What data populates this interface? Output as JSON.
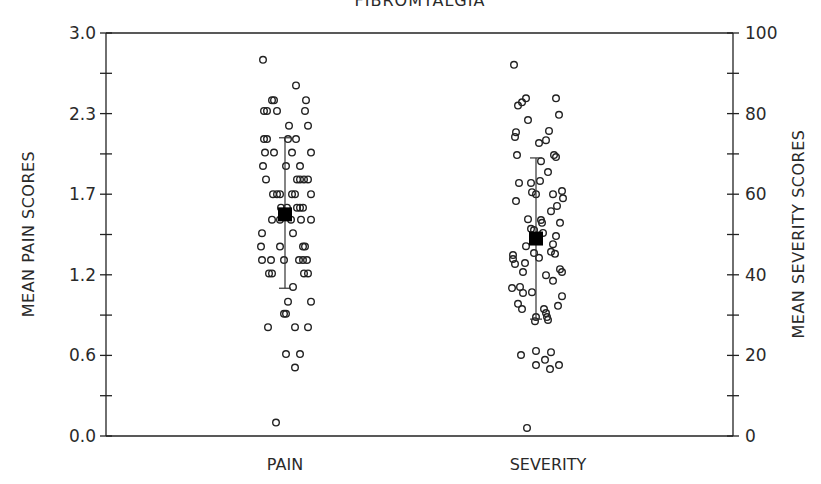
{
  "chart_data": {
    "type": "scatter",
    "title": "FIBROMYALGIA",
    "categories": [
      "PAIN",
      "SEVERITY"
    ],
    "left_axis": {
      "label": "MEAN PAIN SCORES",
      "ylim": [
        0.0,
        3.0
      ],
      "tick_labels": [
        "0.0",
        "0.6",
        "1.2",
        "1.7",
        "2.3",
        "3.0"
      ]
    },
    "right_axis": {
      "label": "MEAN SEVERITY SCORES",
      "ylim": [
        0,
        100
      ],
      "tick_labels": [
        "0",
        "20",
        "40",
        "60",
        "80",
        "100"
      ]
    },
    "grid": false,
    "series": [
      {
        "name": "PAIN",
        "axis": "left",
        "mean": 1.65,
        "sd_low": 1.1,
        "sd_high": 2.22,
        "points": [
          {
            "v": 2.8,
            "dx": -22
          },
          {
            "v": 2.61,
            "dx": 11
          },
          {
            "v": 2.5,
            "dx": -13
          },
          {
            "v": 2.5,
            "dx": -11
          },
          {
            "v": 2.5,
            "dx": 21
          },
          {
            "v": 2.42,
            "dx": -21
          },
          {
            "v": 2.42,
            "dx": -18
          },
          {
            "v": 2.42,
            "dx": -8
          },
          {
            "v": 2.42,
            "dx": 20
          },
          {
            "v": 2.31,
            "dx": 4
          },
          {
            "v": 2.31,
            "dx": 23
          },
          {
            "v": 2.21,
            "dx": -21
          },
          {
            "v": 2.21,
            "dx": -18
          },
          {
            "v": 2.21,
            "dx": 3
          },
          {
            "v": 2.21,
            "dx": 11
          },
          {
            "v": 2.11,
            "dx": -20
          },
          {
            "v": 2.11,
            "dx": -11
          },
          {
            "v": 2.11,
            "dx": 7
          },
          {
            "v": 2.11,
            "dx": 26
          },
          {
            "v": 2.01,
            "dx": -22
          },
          {
            "v": 2.01,
            "dx": 1
          },
          {
            "v": 2.01,
            "dx": 15
          },
          {
            "v": 1.91,
            "dx": -19
          },
          {
            "v": 1.91,
            "dx": 12
          },
          {
            "v": 1.91,
            "dx": 15
          },
          {
            "v": 1.91,
            "dx": 19
          },
          {
            "v": 1.91,
            "dx": 23
          },
          {
            "v": 1.8,
            "dx": -12
          },
          {
            "v": 1.8,
            "dx": -8
          },
          {
            "v": 1.8,
            "dx": -5
          },
          {
            "v": 1.8,
            "dx": 7
          },
          {
            "v": 1.8,
            "dx": 10
          },
          {
            "v": 1.8,
            "dx": 26
          },
          {
            "v": 1.7,
            "dx": -4
          },
          {
            "v": 1.7,
            "dx": 2
          },
          {
            "v": 1.7,
            "dx": 12
          },
          {
            "v": 1.7,
            "dx": 15
          },
          {
            "v": 1.7,
            "dx": 18
          },
          {
            "v": 1.61,
            "dx": -13
          },
          {
            "v": 1.61,
            "dx": -5
          },
          {
            "v": 1.61,
            "dx": 6
          },
          {
            "v": 1.61,
            "dx": 16
          },
          {
            "v": 1.61,
            "dx": 26
          },
          {
            "v": 1.51,
            "dx": -23
          },
          {
            "v": 1.51,
            "dx": 8
          },
          {
            "v": 1.41,
            "dx": -24
          },
          {
            "v": 1.41,
            "dx": -5
          },
          {
            "v": 1.41,
            "dx": 18
          },
          {
            "v": 1.41,
            "dx": 20
          },
          {
            "v": 1.31,
            "dx": -23
          },
          {
            "v": 1.31,
            "dx": -14
          },
          {
            "v": 1.31,
            "dx": -1
          },
          {
            "v": 1.31,
            "dx": 14
          },
          {
            "v": 1.31,
            "dx": 18
          },
          {
            "v": 1.31,
            "dx": 22
          },
          {
            "v": 1.21,
            "dx": -16
          },
          {
            "v": 1.21,
            "dx": -13
          },
          {
            "v": 1.21,
            "dx": 19
          },
          {
            "v": 1.21,
            "dx": 23
          },
          {
            "v": 1.11,
            "dx": 8
          },
          {
            "v": 1.0,
            "dx": 3
          },
          {
            "v": 1.0,
            "dx": 26
          },
          {
            "v": 0.91,
            "dx": -1
          },
          {
            "v": 0.91,
            "dx": 1
          },
          {
            "v": 0.81,
            "dx": -17
          },
          {
            "v": 0.81,
            "dx": 10
          },
          {
            "v": 0.81,
            "dx": 23
          },
          {
            "v": 0.61,
            "dx": 1
          },
          {
            "v": 0.61,
            "dx": 15
          },
          {
            "v": 0.51,
            "dx": 10
          },
          {
            "v": 0.1,
            "dx": -9
          }
        ]
      },
      {
        "name": "SEVERITY",
        "axis": "right",
        "mean": 49.0,
        "sd_low": 29.0,
        "sd_high": 69.0,
        "points": [
          {
            "v": 92.1,
            "dx": -22
          },
          {
            "v": 82.0,
            "dx": -18
          },
          {
            "v": 82.8,
            "dx": -14
          },
          {
            "v": 83.8,
            "dx": -10
          },
          {
            "v": 83.8,
            "dx": 20
          },
          {
            "v": 78.4,
            "dx": -8
          },
          {
            "v": 79.7,
            "dx": 23
          },
          {
            "v": 75.4,
            "dx": -20
          },
          {
            "v": 74.2,
            "dx": -21
          },
          {
            "v": 75.7,
            "dx": 13
          },
          {
            "v": 72.7,
            "dx": 3
          },
          {
            "v": 73.4,
            "dx": 10
          },
          {
            "v": 69.7,
            "dx": -19
          },
          {
            "v": 69.7,
            "dx": 18
          },
          {
            "v": 69.2,
            "dx": 20
          },
          {
            "v": 68.2,
            "dx": 5
          },
          {
            "v": 65.5,
            "dx": 12
          },
          {
            "v": 62.8,
            "dx": -17
          },
          {
            "v": 62.8,
            "dx": -5
          },
          {
            "v": 63.3,
            "dx": 4
          },
          {
            "v": 60.5,
            "dx": -4
          },
          {
            "v": 60.0,
            "dx": 0
          },
          {
            "v": 60.0,
            "dx": 17
          },
          {
            "v": 60.8,
            "dx": 26
          },
          {
            "v": 58.3,
            "dx": -20
          },
          {
            "v": 59.0,
            "dx": 27
          },
          {
            "v": 55.8,
            "dx": 15
          },
          {
            "v": 57.1,
            "dx": 21
          },
          {
            "v": 53.8,
            "dx": -8
          },
          {
            "v": 53.6,
            "dx": 5
          },
          {
            "v": 52.9,
            "dx": 6
          },
          {
            "v": 52.9,
            "dx": 24
          },
          {
            "v": 51.4,
            "dx": -5
          },
          {
            "v": 51.1,
            "dx": -2
          },
          {
            "v": 50.4,
            "dx": 7
          },
          {
            "v": 49.6,
            "dx": 20
          },
          {
            "v": 47.1,
            "dx": -10
          },
          {
            "v": 47.6,
            "dx": 17
          },
          {
            "v": 44.9,
            "dx": -23
          },
          {
            "v": 43.9,
            "dx": -23
          },
          {
            "v": 42.7,
            "dx": -21
          },
          {
            "v": 45.4,
            "dx": -2
          },
          {
            "v": 44.2,
            "dx": 3
          },
          {
            "v": 45.7,
            "dx": 15
          },
          {
            "v": 45.2,
            "dx": 19
          },
          {
            "v": 42.9,
            "dx": -11
          },
          {
            "v": 40.7,
            "dx": -13
          },
          {
            "v": 39.9,
            "dx": 10
          },
          {
            "v": 41.4,
            "dx": 24
          },
          {
            "v": 40.7,
            "dx": 26
          },
          {
            "v": 38.5,
            "dx": 17
          },
          {
            "v": 36.7,
            "dx": -24
          },
          {
            "v": 37.0,
            "dx": -16
          },
          {
            "v": 35.5,
            "dx": -13
          },
          {
            "v": 35.7,
            "dx": -4
          },
          {
            "v": 34.7,
            "dx": 26
          },
          {
            "v": 32.8,
            "dx": -18
          },
          {
            "v": 31.5,
            "dx": -14
          },
          {
            "v": 31.5,
            "dx": 8
          },
          {
            "v": 32.3,
            "dx": 22
          },
          {
            "v": 29.5,
            "dx": 0
          },
          {
            "v": 30.5,
            "dx": 10
          },
          {
            "v": 29.5,
            "dx": 11
          },
          {
            "v": 28.5,
            "dx": -1
          },
          {
            "v": 28.8,
            "dx": 12
          },
          {
            "v": 20.1,
            "dx": -15
          },
          {
            "v": 21.1,
            "dx": 0
          },
          {
            "v": 20.8,
            "dx": 15
          },
          {
            "v": 17.6,
            "dx": 0
          },
          {
            "v": 18.9,
            "dx": 9
          },
          {
            "v": 16.6,
            "dx": 14
          },
          {
            "v": 17.6,
            "dx": 23
          },
          {
            "v": 2.0,
            "dx": -9
          }
        ]
      }
    ]
  }
}
